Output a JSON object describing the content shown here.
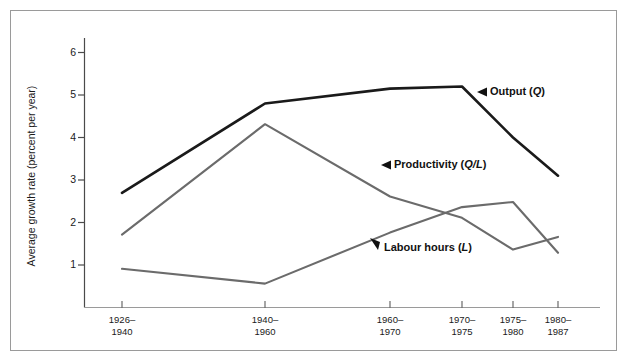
{
  "figure": {
    "border_color": "#9a9a9a",
    "background": "#ffffff"
  },
  "chart_data": {
    "type": "line",
    "title": "",
    "xlabel": "",
    "ylabel": "Average growth rate (percent per year)",
    "categories": [
      "1926–\n1940",
      "1940–\n1960",
      "1960–\n1970",
      "1970–\n1975",
      "1975–\n1980",
      "1980–\n1987"
    ],
    "categories_flat": [
      "1926–1940",
      "1940–1960",
      "1960–1970",
      "1970–1975",
      "1975–1980",
      "1980–1987"
    ],
    "ylim": [
      0,
      6.6
    ],
    "yticks": [
      0,
      1,
      2,
      3,
      4,
      5,
      6
    ],
    "ytick_labels": [
      "0",
      "1",
      "2",
      "3",
      "4",
      "5",
      "6"
    ],
    "grid": false,
    "legend": "inline-annotations",
    "series": [
      {
        "name": "Output (Q)",
        "label_html": "Output (<em>Q</em>)",
        "color": "#1a1a1a",
        "values": [
          2.7,
          4.8,
          5.15,
          5.2,
          4.0,
          3.1
        ]
      },
      {
        "name": "Productivity (Q/L)",
        "label_html": "Productivity (<em>Q/L</em>)",
        "color": "#6b6b6b",
        "values": [
          1.7,
          4.3,
          2.6,
          2.1,
          1.35,
          1.65
        ]
      },
      {
        "name": "Labour hours (L)",
        "label_html": "Labour hours (<em>L</em>)",
        "color": "#6b6b6b",
        "values": [
          0.9,
          0.55,
          1.75,
          2.35,
          2.47,
          1.3
        ]
      }
    ]
  },
  "annotations": [
    {
      "id": "output",
      "text": "Output (Q)",
      "arrow": "left-triangle"
    },
    {
      "id": "productivity",
      "text": "Productivity (Q/L)",
      "arrow": "left-triangle"
    },
    {
      "id": "labour",
      "text": "Labour hours (L)",
      "arrow": "up-left-triangle"
    }
  ]
}
